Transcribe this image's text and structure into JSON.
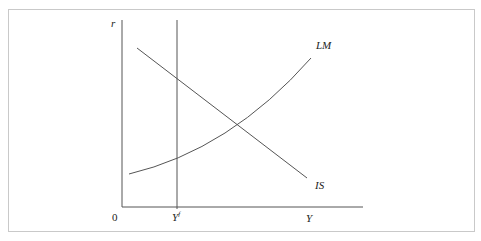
{
  "diagram": {
    "type": "IS-LM",
    "axes": {
      "y_label": "r",
      "x_label": "Y",
      "origin_label": "0"
    },
    "vertical_line": {
      "label_main": "Y",
      "label_sup": "f"
    },
    "curves": [
      {
        "name": "LM",
        "label": "LM",
        "shape": "upward-sloping convex"
      },
      {
        "name": "IS",
        "label": "IS",
        "shape": "downward-sloping line"
      }
    ],
    "colors": {
      "line": "#555555",
      "border": "#c9c9c9",
      "text": "#222222"
    }
  }
}
